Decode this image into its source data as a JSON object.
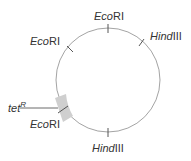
{
  "diagram": {
    "type": "plasmid-map",
    "circle": {
      "cx": 108,
      "cy": 80,
      "r": 52,
      "stroke": "#888888"
    },
    "marker": {
      "label_italic": "tet",
      "label_sup": "R",
      "color": "#c8c8c8"
    },
    "sites": [
      {
        "italic": "Eco",
        "rest": "RI",
        "position": "top"
      },
      {
        "italic": "Hind",
        "rest": "III",
        "position": "upper-right"
      },
      {
        "italic": "Eco",
        "rest": "RI",
        "position": "upper-left"
      },
      {
        "italic": "Eco",
        "rest": "RI",
        "position": "lower-left"
      },
      {
        "italic": "Hind",
        "rest": "III",
        "position": "bottom"
      }
    ]
  }
}
